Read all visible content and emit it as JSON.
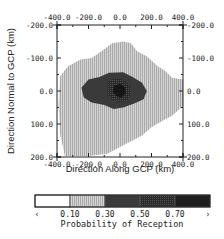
{
  "chart_data": {
    "type": "heatmap",
    "title": "",
    "xlabel": "Direction Along GCP (km)",
    "ylabel": "Direction Normal to GCP (km)",
    "xlim": [
      -400,
      400
    ],
    "ylim": [
      -200,
      200
    ],
    "y_inverted": true,
    "x_ticks": [
      "-400.0",
      "-200.0",
      "0.0",
      "200.0",
      "400.0"
    ],
    "x_tick_values": [
      -400,
      -200,
      0,
      200,
      400
    ],
    "y_ticks": [
      "-200.0",
      "-100.0",
      "0.0",
      "100.0",
      "200.0"
    ],
    "y_tick_values": [
      -200,
      -100,
      0,
      100,
      200
    ],
    "grid": false,
    "colorbar": {
      "title": "Probability of Reception",
      "bounds": [
        0.1,
        0.3,
        0.5,
        0.7
      ],
      "labels": [
        "‹",
        "0.10",
        "0.30",
        "0.50",
        "0.70",
        "›"
      ],
      "levels": [
        {
          "range": "< 0.10",
          "color": "#ffffff",
          "pattern": "none"
        },
        {
          "range": "0.10-0.30",
          "color": "#c8c8c8",
          "pattern": "stipple"
        },
        {
          "range": "0.30-0.50",
          "color": "#3c3c3c",
          "pattern": "solid"
        },
        {
          "range": "0.50-0.70",
          "color": "#2e2e2e",
          "pattern": "stipple"
        },
        {
          "range": "> 0.70",
          "color": "#1a1a1a",
          "pattern": "solid"
        }
      ]
    },
    "regions": [
      {
        "level": "0.10-0.30",
        "outline": [
          [
            -380,
            -45
          ],
          [
            -330,
            -75
          ],
          [
            -250,
            -95
          ],
          [
            -180,
            -100
          ],
          [
            -120,
            -120
          ],
          [
            -50,
            -145
          ],
          [
            20,
            -150
          ],
          [
            70,
            -145
          ],
          [
            110,
            -120
          ],
          [
            170,
            -105
          ],
          [
            240,
            -75
          ],
          [
            290,
            -60
          ],
          [
            330,
            -40
          ],
          [
            400,
            -35
          ],
          [
            400,
            45
          ],
          [
            330,
            75
          ],
          [
            270,
            90
          ],
          [
            200,
            110
          ],
          [
            140,
            135
          ],
          [
            80,
            150
          ],
          [
            0,
            170
          ],
          [
            -80,
            190
          ],
          [
            -200,
            197
          ],
          [
            -350,
            197
          ],
          [
            -380,
            130
          ],
          [
            -390,
            40
          ]
        ]
      },
      {
        "level": "0.30-0.50",
        "outline": [
          [
            -245,
            -10
          ],
          [
            -200,
            -35
          ],
          [
            -130,
            -42
          ],
          [
            -70,
            -55
          ],
          [
            20,
            -57
          ],
          [
            80,
            -42
          ],
          [
            140,
            -25
          ],
          [
            170,
            0
          ],
          [
            150,
            25
          ],
          [
            90,
            38
          ],
          [
            20,
            50
          ],
          [
            -40,
            55
          ],
          [
            -100,
            42
          ],
          [
            -180,
            35
          ],
          [
            -230,
            20
          ]
        ]
      },
      {
        "level": "0.50-0.70",
        "outline": [
          [
            -80,
            -30
          ],
          [
            -30,
            -38
          ],
          [
            20,
            -35
          ],
          [
            60,
            -20
          ],
          [
            70,
            5
          ],
          [
            50,
            28
          ],
          [
            0,
            35
          ],
          [
            -50,
            28
          ],
          [
            -80,
            10
          ]
        ]
      },
      {
        "level": "> 0.70",
        "outline": [
          [
            -40,
            -15
          ],
          [
            0,
            -22
          ],
          [
            30,
            -12
          ],
          [
            35,
            8
          ],
          [
            10,
            20
          ],
          [
            -25,
            15
          ],
          [
            -45,
            3
          ]
        ]
      }
    ]
  }
}
